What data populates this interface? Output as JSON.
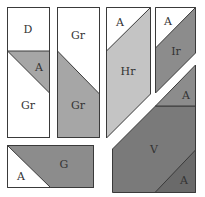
{
  "colors": {
    "white": "#ffffff",
    "light_gray": "#c4c4c4",
    "mid_gray": "#a6a6a6",
    "dark_gray": "#8c8c8c",
    "darker_gray": "#7a7a7a",
    "outline": "#3a3a3a"
  },
  "pieces": {
    "p1": {
      "top_label": "D",
      "triangle_label": "A",
      "bottom_label": "Gr"
    },
    "p2": {
      "top_label": "Gr",
      "bottom_label": "Gr"
    },
    "p3": {
      "triangle_label": "A",
      "main_label": "Hr"
    },
    "p4": {
      "triangle_label": "A",
      "main_label": "Ir"
    },
    "p5": {
      "top_label": "A",
      "main_label": "V",
      "corner_label": "A"
    },
    "p6": {
      "triangle_label": "A",
      "main_label": "G"
    }
  }
}
